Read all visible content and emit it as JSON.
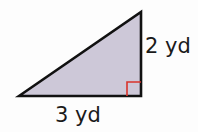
{
  "diagram": {
    "type": "right-triangle",
    "vertices": {
      "left": [
        19,
        96
      ],
      "top": [
        141,
        12
      ],
      "right_angle": [
        141,
        96
      ]
    },
    "colors": {
      "fill": "#cdc8d8",
      "stroke": "#111111",
      "right_angle_marker": "#d9332b"
    },
    "labels": {
      "vertical_leg": "2 yd",
      "horizontal_leg": "3 yd"
    },
    "right_angle_marker_size": 14
  }
}
